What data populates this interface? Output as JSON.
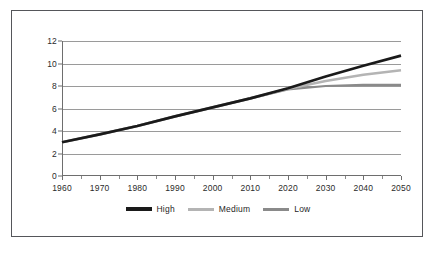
{
  "chart_data": {
    "type": "line",
    "title": "",
    "subtitle": "",
    "xlabel": "",
    "ylabel": "",
    "xlim": [
      1960,
      2050
    ],
    "ylim": [
      0,
      12
    ],
    "grid": true,
    "legend_position": "bottom",
    "x_ticks": [
      1960,
      1970,
      1980,
      1990,
      2000,
      2010,
      2020,
      2030,
      2040,
      2050
    ],
    "x_minor_tick_interval": 5,
    "y_ticks": [
      0,
      2,
      4,
      6,
      8,
      10,
      12
    ],
    "x": [
      1960,
      1970,
      1980,
      1990,
      2000,
      2010,
      2020,
      2030,
      2040,
      2050
    ],
    "series": [
      {
        "name": "High",
        "color": "#1a1a1a",
        "width": 2.6,
        "values": [
          3.0,
          3.7,
          4.45,
          5.3,
          6.1,
          6.9,
          7.8,
          8.85,
          9.8,
          10.7
        ]
      },
      {
        "name": "Medium",
        "color": "#b4b4b4",
        "width": 2.6,
        "values": [
          3.0,
          3.7,
          4.45,
          5.3,
          6.1,
          6.9,
          7.75,
          8.45,
          9.0,
          9.4
        ]
      },
      {
        "name": "Low",
        "color": "#8a8a8a",
        "width": 2.2,
        "values": [
          3.0,
          3.7,
          4.45,
          5.3,
          6.1,
          6.9,
          7.7,
          8.0,
          8.1,
          8.1
        ]
      }
    ]
  },
  "legend": {
    "items": [
      {
        "label": "High",
        "color": "#1a1a1a"
      },
      {
        "label": "Medium",
        "color": "#b4b4b4"
      },
      {
        "label": "Low",
        "color": "#8a8a8a"
      }
    ]
  },
  "axes": {
    "y_tick_labels": [
      "0",
      "2",
      "4",
      "6",
      "8",
      "10",
      "12"
    ],
    "x_tick_labels": [
      "1960",
      "1970",
      "1980",
      "1990",
      "2000",
      "2010",
      "2020",
      "2030",
      "2040",
      "2050"
    ]
  },
  "style": {
    "border_color": "#55565a",
    "gridline_color": "#9a9a9a",
    "axis_color": "#6e6e6e",
    "background": "#ffffff",
    "text_color": "#2b2b2b"
  }
}
